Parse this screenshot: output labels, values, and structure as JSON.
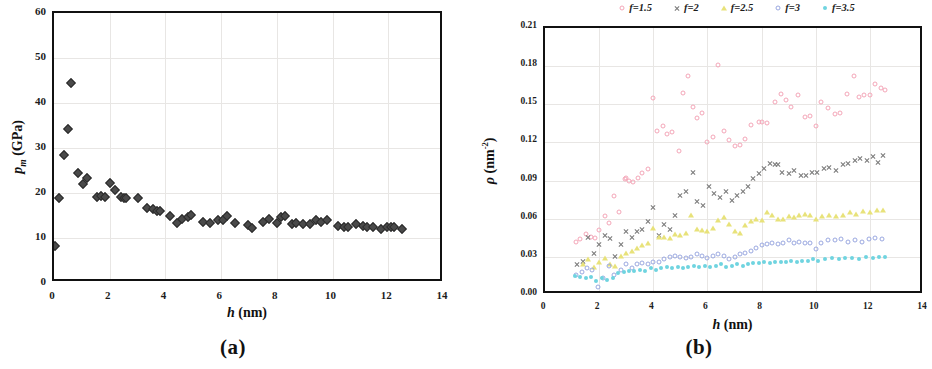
{
  "figure": {
    "panels": [
      {
        "id": "a",
        "subcaption": "(a)",
        "xlabel_var": "h",
        "xlabel_unit": "(nm)",
        "ylabel_var": "p",
        "ylabel_sub": "m",
        "ylabel_unit": "(GPa)"
      },
      {
        "id": "b",
        "subcaption": "(b)",
        "xlabel_var": "h",
        "xlabel_unit": "(nm)",
        "ylabel_var": "ρ",
        "ylabel_unit": "(nm",
        "ylabel_sup": "-2",
        "ylabel_close": ")"
      }
    ],
    "legend": [
      {
        "label": "f=1.5",
        "color": "#f4a6b8",
        "marker": "ring"
      },
      {
        "label": "f=2",
        "color": "#7a7a7a",
        "marker": "cross"
      },
      {
        "label": "f=2.5",
        "color": "#e8e27a",
        "marker": "tri"
      },
      {
        "label": "f=3",
        "color": "#9aa8e0",
        "marker": "ring"
      },
      {
        "label": "f=3.5",
        "color": "#6fd4e0",
        "marker": "dot"
      }
    ]
  },
  "chart_data": [
    {
      "type": "scatter",
      "panel": "a",
      "title": "(a)",
      "xlabel": "h (nm)",
      "ylabel": "p_m (GPa)",
      "xlim": [
        0,
        14
      ],
      "ylim": [
        0,
        60
      ],
      "xticks": [
        0,
        2,
        4,
        6,
        8,
        10,
        12,
        14
      ],
      "yticks": [
        0,
        10,
        20,
        30,
        40,
        50,
        60
      ],
      "grid": true,
      "legend": "none",
      "marker": "diamond",
      "marker_color": "#4a4a4a",
      "series": [
        {
          "name": "p_m",
          "x": [
            0.05,
            0.18,
            0.35,
            0.52,
            0.62,
            0.85,
            1.05,
            1.2,
            1.55,
            1.7,
            1.82,
            2.0,
            2.2,
            2.4,
            2.5,
            2.6,
            3.0,
            3.35,
            3.55,
            3.7,
            3.8,
            4.15,
            4.4,
            4.6,
            4.8,
            4.9,
            5.35,
            5.6,
            5.9,
            6.05,
            6.2,
            6.5,
            6.95,
            7.1,
            7.5,
            7.7,
            8.0,
            8.15,
            8.3,
            8.55,
            8.7,
            8.95,
            9.2,
            9.4,
            9.6,
            9.8,
            10.2,
            10.4,
            10.55,
            10.85,
            11.1,
            11.25,
            11.45,
            11.75,
            11.95,
            12.1,
            12.2,
            12.5
          ],
          "y": [
            8.3,
            19.0,
            28.5,
            34.2,
            44.4,
            24.4,
            21.9,
            23.4,
            19.2,
            19.4,
            19.2,
            22.2,
            20.7,
            19.2,
            19.0,
            18.9,
            19.0,
            16.7,
            16.5,
            16.1,
            16.0,
            14.9,
            13.3,
            14.2,
            14.6,
            15.1,
            13.5,
            13.4,
            13.9,
            14.1,
            15.0,
            13.4,
            12.8,
            12.3,
            13.6,
            14.2,
            13.3,
            14.6,
            14.8,
            13.2,
            13.3,
            13.1,
            13.1,
            13.9,
            13.6,
            13.9,
            12.7,
            12.4,
            12.4,
            13.1,
            12.6,
            12.5,
            12.4,
            11.9,
            12.5,
            12.4,
            12.5,
            12.1
          ]
        }
      ]
    },
    {
      "type": "scatter",
      "panel": "b",
      "title": "(b)",
      "xlabel": "h (nm)",
      "ylabel": "ρ (nm-2)",
      "xlim": [
        0,
        14
      ],
      "ylim": [
        0.0,
        0.21
      ],
      "xticks": [
        0,
        2,
        4,
        6,
        8,
        10,
        12,
        14
      ],
      "yticks": [
        0.0,
        0.03,
        0.06,
        0.09,
        0.12,
        0.15,
        0.18,
        0.21
      ],
      "ytick_labels": [
        "0.00",
        "0.03",
        "0.06",
        "0.09",
        "0.12",
        "0.15",
        "0.18",
        "0.21"
      ],
      "grid": true,
      "legend": "top-center",
      "series": [
        {
          "name": "f=1.5",
          "color": "#f4a6b8",
          "marker": "ring",
          "x": [
            1.15,
            1.3,
            1.5,
            1.7,
            1.85,
            2.0,
            2.2,
            2.35,
            2.55,
            2.75,
            2.95,
            3.0,
            3.1,
            3.25,
            3.45,
            3.6,
            3.8,
            4.0,
            4.15,
            4.35,
            4.5,
            4.7,
            4.95,
            5.1,
            5.3,
            5.45,
            5.6,
            5.8,
            6.0,
            6.2,
            6.4,
            6.6,
            6.8,
            7.0,
            7.2,
            7.4,
            7.6,
            7.9,
            8.0,
            8.2,
            8.5,
            8.7,
            8.9,
            9.1,
            9.35,
            9.6,
            9.8,
            10.0,
            10.2,
            10.45,
            10.7,
            10.9,
            11.15,
            11.4,
            11.6,
            11.8,
            12.0,
            12.2,
            12.4,
            12.55
          ],
          "y": [
            0.042,
            0.044,
            0.048,
            0.046,
            0.045,
            0.051,
            0.062,
            0.057,
            0.078,
            0.065,
            0.091,
            0.092,
            0.09,
            0.089,
            0.092,
            0.096,
            0.099,
            0.155,
            0.129,
            0.133,
            0.127,
            0.128,
            0.113,
            0.159,
            0.172,
            0.148,
            0.139,
            0.143,
            0.12,
            0.124,
            0.181,
            0.129,
            0.122,
            0.117,
            0.118,
            0.123,
            0.134,
            0.136,
            0.136,
            0.135,
            0.152,
            0.158,
            0.153,
            0.148,
            0.157,
            0.14,
            0.141,
            0.133,
            0.152,
            0.147,
            0.142,
            0.143,
            0.158,
            0.172,
            0.156,
            0.157,
            0.157,
            0.166,
            0.163,
            0.161
          ]
        },
        {
          "name": "f=2",
          "color": "#7a7a7a",
          "marker": "cross",
          "x": [
            1.2,
            1.4,
            1.6,
            1.8,
            2.0,
            2.2,
            2.4,
            2.6,
            2.8,
            3.0,
            3.2,
            3.4,
            3.6,
            3.8,
            4.0,
            4.2,
            4.4,
            4.6,
            4.8,
            5.0,
            5.2,
            5.45,
            5.6,
            5.85,
            6.05,
            6.25,
            6.45,
            6.7,
            6.9,
            7.1,
            7.3,
            7.5,
            7.7,
            7.9,
            8.1,
            8.3,
            8.5,
            8.6,
            8.75,
            9.0,
            9.2,
            9.45,
            9.65,
            9.85,
            10.05,
            10.3,
            10.5,
            10.75,
            11.0,
            11.2,
            11.45,
            11.65,
            11.9,
            12.1,
            12.3,
            12.5
          ],
          "y": [
            0.024,
            0.027,
            0.046,
            0.033,
            0.04,
            0.047,
            0.045,
            0.031,
            0.04,
            0.05,
            0.046,
            0.05,
            0.052,
            0.058,
            0.069,
            0.047,
            0.056,
            0.052,
            0.063,
            0.079,
            0.082,
            0.097,
            0.074,
            0.071,
            0.086,
            0.08,
            0.077,
            0.082,
            0.075,
            0.079,
            0.082,
            0.086,
            0.092,
            0.096,
            0.1,
            0.104,
            0.103,
            0.103,
            0.097,
            0.096,
            0.098,
            0.094,
            0.094,
            0.097,
            0.097,
            0.1,
            0.101,
            0.098,
            0.103,
            0.104,
            0.106,
            0.108,
            0.106,
            0.109,
            0.105,
            0.11
          ]
        },
        {
          "name": "f=2.5",
          "color": "#e8e27a",
          "marker": "tri",
          "x": [
            1.4,
            1.6,
            1.8,
            2.0,
            2.2,
            2.4,
            2.6,
            2.8,
            3.0,
            3.2,
            3.4,
            3.6,
            3.8,
            4.0,
            4.2,
            4.4,
            4.6,
            4.8,
            5.0,
            5.2,
            5.4,
            5.6,
            5.8,
            6.0,
            6.2,
            6.4,
            6.6,
            6.8,
            7.0,
            7.2,
            7.4,
            7.6,
            7.8,
            8.0,
            8.2,
            8.4,
            8.6,
            8.8,
            9.0,
            9.2,
            9.4,
            9.6,
            9.8,
            10.0,
            10.25,
            10.5,
            10.75,
            11.0,
            11.25,
            11.5,
            11.75,
            12.0,
            12.25,
            12.5
          ],
          "y": [
            0.024,
            0.028,
            0.022,
            0.026,
            0.029,
            0.024,
            0.023,
            0.031,
            0.033,
            0.035,
            0.037,
            0.039,
            0.041,
            0.053,
            0.046,
            0.046,
            0.045,
            0.048,
            0.047,
            0.049,
            0.063,
            0.052,
            0.051,
            0.05,
            0.053,
            0.059,
            0.061,
            0.056,
            0.05,
            0.049,
            0.055,
            0.058,
            0.06,
            0.059,
            0.065,
            0.063,
            0.06,
            0.06,
            0.062,
            0.061,
            0.063,
            0.064,
            0.063,
            0.06,
            0.062,
            0.063,
            0.062,
            0.063,
            0.065,
            0.064,
            0.066,
            0.065,
            0.067,
            0.067
          ]
        },
        {
          "name": "f=3",
          "color": "#9aa8e0",
          "marker": "ring",
          "x": [
            1.15,
            1.35,
            1.55,
            1.75,
            1.95,
            2.15,
            2.35,
            2.55,
            2.8,
            3.0,
            3.2,
            3.4,
            3.6,
            3.8,
            4.0,
            4.2,
            4.4,
            4.6,
            4.8,
            5.0,
            5.2,
            5.4,
            5.6,
            5.8,
            6.0,
            6.2,
            6.4,
            6.6,
            6.8,
            7.0,
            7.2,
            7.4,
            7.6,
            7.8,
            8.0,
            8.2,
            8.4,
            8.6,
            8.8,
            9.0,
            9.2,
            9.4,
            9.6,
            9.8,
            10.0,
            10.2,
            10.45,
            10.7,
            10.95,
            11.2,
            11.45,
            11.7,
            11.95,
            12.2,
            12.45
          ],
          "y": [
            0.016,
            0.018,
            0.021,
            0.02,
            0.006,
            0.013,
            0.023,
            0.016,
            0.02,
            0.024,
            0.021,
            0.024,
            0.025,
            0.024,
            0.026,
            0.026,
            0.028,
            0.03,
            0.031,
            0.03,
            0.029,
            0.03,
            0.032,
            0.031,
            0.029,
            0.031,
            0.032,
            0.031,
            0.028,
            0.03,
            0.032,
            0.033,
            0.035,
            0.037,
            0.039,
            0.04,
            0.041,
            0.04,
            0.041,
            0.043,
            0.041,
            0.042,
            0.041,
            0.041,
            0.036,
            0.041,
            0.043,
            0.043,
            0.044,
            0.042,
            0.043,
            0.042,
            0.044,
            0.045,
            0.044
          ]
        },
        {
          "name": "f=3.5",
          "color": "#6fd4e0",
          "marker": "dot",
          "x": [
            1.1,
            1.3,
            1.5,
            1.7,
            1.9,
            2.1,
            2.3,
            2.5,
            2.7,
            2.9,
            3.1,
            3.3,
            3.5,
            3.7,
            3.9,
            4.1,
            4.3,
            4.5,
            4.7,
            4.9,
            5.1,
            5.3,
            5.5,
            5.7,
            5.9,
            6.1,
            6.3,
            6.5,
            6.7,
            6.9,
            7.1,
            7.3,
            7.5,
            7.7,
            7.9,
            8.1,
            8.3,
            8.5,
            8.7,
            8.9,
            9.1,
            9.3,
            9.5,
            9.7,
            9.9,
            10.1,
            10.35,
            10.6,
            10.85,
            11.1,
            11.35,
            11.6,
            11.85,
            12.1,
            12.35,
            12.55
          ],
          "y": [
            0.015,
            0.014,
            0.013,
            0.014,
            0.011,
            0.013,
            0.012,
            0.013,
            0.017,
            0.018,
            0.019,
            0.019,
            0.02,
            0.019,
            0.021,
            0.02,
            0.021,
            0.022,
            0.021,
            0.022,
            0.021,
            0.022,
            0.023,
            0.022,
            0.023,
            0.022,
            0.023,
            0.024,
            0.022,
            0.023,
            0.024,
            0.023,
            0.024,
            0.025,
            0.025,
            0.026,
            0.025,
            0.026,
            0.026,
            0.026,
            0.027,
            0.026,
            0.027,
            0.027,
            0.028,
            0.027,
            0.028,
            0.029,
            0.028,
            0.029,
            0.029,
            0.028,
            0.03,
            0.029,
            0.03,
            0.03
          ]
        }
      ]
    }
  ]
}
